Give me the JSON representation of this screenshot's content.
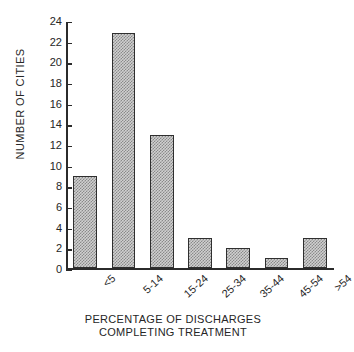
{
  "chart_data": {
    "type": "bar",
    "title": "",
    "categories": [
      "<5",
      "5-14",
      "15-24",
      "25-34",
      "35-44",
      "45-54",
      ">54"
    ],
    "values": [
      9,
      23,
      13,
      3,
      2,
      1,
      3
    ],
    "xlabel": "PERCENTAGE OF DISCHARGES COMPLETING TREATMENT",
    "xlabel_lines": [
      "PERCENTAGE OF DISCHARGES",
      "COMPLETING TREATMENT"
    ],
    "ylabel": "NUMBER OF CITIES",
    "ylim": [
      0,
      24
    ],
    "ytick_labels": [
      "0",
      "2",
      "4",
      "6",
      "8",
      "10",
      "12",
      "14",
      "16",
      "18",
      "20",
      "22",
      "24"
    ],
    "ytick_values": [
      0,
      2,
      4,
      6,
      8,
      10,
      12,
      14,
      16,
      18,
      20,
      22,
      24
    ],
    "ytick_step": 2,
    "grid": false,
    "legend": null,
    "legend_position": "none",
    "bar_fill_color": "#d0d0d0",
    "bar_pattern_color": "#8a8a8a",
    "bar_border_color": "#2f2f2f",
    "axis_color": "#2b2b2b",
    "background_color": "#ffffff",
    "text_color": "#262626"
  }
}
